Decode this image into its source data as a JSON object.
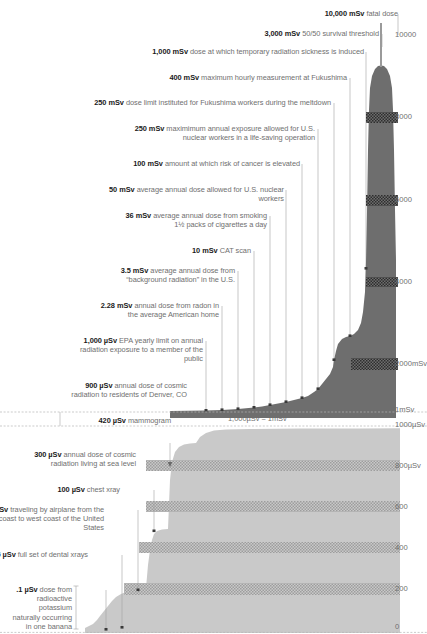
{
  "chart_data": {
    "type": "area",
    "note": "1,000µSv = 1mSv",
    "panels": [
      {
        "name": "upper-panel-msv",
        "ylabel": "mSv",
        "ylim": [
          0,
          11000
        ],
        "ticks": [
          "10000",
          "8000",
          "6000",
          "4000",
          "2000mSv",
          "1mSv"
        ],
        "tick_values": [
          10000,
          8000,
          6000,
          4000,
          2000,
          1
        ],
        "categories": [
          "420 µSv mammogram",
          "900 µSv cosmic radiation Denver",
          "1,000 µSv EPA yearly limit",
          "2.28 mSv radon average home",
          "3.5 mSv background radiation U.S.",
          "10 mSv CAT scan",
          "36 mSv smoking 1½ packs a day",
          "50 mSv U.S. nuclear workers",
          "100 mSv cancer risk elevated",
          "250 mSv life-saving operation",
          "250 mSv Fukushima workers",
          "400 mSv Fukushima hourly max",
          "1,000 mSv radiation sickness",
          "3,000 mSv 50/50 survival",
          "10,000 mSv fatal dose"
        ],
        "values": [
          0.42,
          0.9,
          1.0,
          2.28,
          3.5,
          10,
          36,
          50,
          100,
          250,
          250,
          400,
          1000,
          3000,
          10000
        ]
      },
      {
        "name": "lower-panel-usv",
        "ylabel": "µSv",
        "ylim": [
          0,
          1000
        ],
        "ticks": [
          "1000µSv",
          "800µSv",
          "600",
          "400",
          "200",
          "0"
        ],
        "tick_values": [
          1000,
          800,
          600,
          400,
          200,
          0
        ],
        "categories": [
          ".1 µSv one banana",
          "5 µSv dental xrays",
          "35 µSv airplane coast to coast",
          "100 µSv chest xray",
          "300 µSv cosmic radiation sea level"
        ],
        "values": [
          0.1,
          5,
          35,
          100,
          300
        ]
      }
    ]
  },
  "divider": {
    "caption": "1,000µSv = 1mSv"
  },
  "axis": {
    "upper_ticks": [
      {
        "label": "10000",
        "y": 35
      },
      {
        "label": "8000",
        "y": 117
      },
      {
        "label": "6000",
        "y": 200
      },
      {
        "label": "4000",
        "y": 282
      },
      {
        "label": "2000mSv",
        "y": 364
      },
      {
        "label": "1mSv",
        "y": 410
      }
    ],
    "lower_ticks": [
      {
        "label": "1000µSv",
        "y": 425
      },
      {
        "label": "800µSv",
        "y": 466
      },
      {
        "label": "600",
        "y": 507
      },
      {
        "label": "400",
        "y": 548
      },
      {
        "label": "200",
        "y": 589
      },
      {
        "label": "0",
        "y": 627
      }
    ]
  },
  "labels_upper": [
    {
      "id": "fatal-dose",
      "amount": "10,000 mSv",
      "desc": " fatal dose",
      "right": 29,
      "top": 9,
      "width": 260
    },
    {
      "id": "survival-threshold",
      "amount": "3,000 mSv",
      "desc": " 50/50 survival threshold",
      "right": 48,
      "top": 29,
      "width": 260
    },
    {
      "id": "radiation-sickness",
      "amount": "1,000 mSv",
      "desc": " dose at which temporary radiation sickness is induced",
      "right": 63,
      "top": 47,
      "width": 215
    },
    {
      "id": "fukushima-hourly-max",
      "amount": "400 mSv",
      "desc": " maximum hourly measurement at Fukushima",
      "right": 80,
      "top": 73,
      "width": 200
    },
    {
      "id": "fukushima-worker-limit",
      "amount": "250 mSv",
      "desc": " dose limit instituted for Fukushima workers during the meltdown",
      "right": 96,
      "top": 98,
      "width": 240
    },
    {
      "id": "nuclear-life-saving",
      "amount": "250 mSv",
      "desc": " maximimum annual exposure allowed for U.S. nuclear workers in a life-saving operation",
      "right": 112,
      "top": 124,
      "width": 190
    },
    {
      "id": "cancer-risk-elevated",
      "amount": "100 mSv",
      "desc": " amount at which risk of cancer is elevated",
      "right": 127,
      "top": 159,
      "width": 175
    },
    {
      "id": "nuclear-worker-annual",
      "amount": "50 mSv",
      "desc": " average annual dose allowed for U.S. nuclear workers",
      "right": 143,
      "top": 185,
      "width": 175
    },
    {
      "id": "smoking-annual",
      "amount": "36 mSv",
      "desc": " average annual dose from smoking 1½ packs of cigarettes a day",
      "right": 160,
      "top": 211,
      "width": 145
    },
    {
      "id": "cat-scan",
      "amount": "10 mSv",
      "desc": " CAT scan",
      "right": 176,
      "top": 246,
      "width": 160
    },
    {
      "id": "background-radiation",
      "amount": "3.5 mSv",
      "desc": " average annual dose from “background radiation” in the U.S.",
      "right": 192,
      "top": 266,
      "width": 125
    },
    {
      "id": "radon-home",
      "amount": "2.28 mSv",
      "desc": " annual dose from radon in the average American home",
      "right": 208,
      "top": 301,
      "width": 125
    },
    {
      "id": "epa-yearly-limit",
      "amount": "1,000 µSv",
      "desc": " EPA yearly limit on annual radiation exposure to a member of the public",
      "right": 224,
      "top": 336,
      "width": 130
    },
    {
      "id": "denver-cosmic",
      "amount": "900 µSv",
      "desc": " annual dose of cosmic radiation to residents of Denver, CO",
      "right": 240,
      "top": 381,
      "width": 125
    },
    {
      "id": "mammogram",
      "amount": "420 µSv",
      "desc": " mammogram",
      "right": 256,
      "top": 416,
      "width": 150
    }
  ],
  "labels_lower": [
    {
      "id": "sea-level-cosmic",
      "amount": "300 µSv",
      "desc": " annual dose of cosmic radiation living at sea level",
      "right": 291,
      "top": 450,
      "width": 125
    },
    {
      "id": "chest-xray",
      "amount": "100 µSv",
      "desc": " chest xray",
      "right": 307,
      "top": 485,
      "width": 150
    },
    {
      "id": "airplane-coast-to-coast",
      "amount": "35 µSv",
      "desc": " traveling by airplane from the east coast to west coast of the United States",
      "right": 323,
      "top": 505,
      "width": 125
    },
    {
      "id": "dental-xrays",
      "amount": "5 µSv",
      "desc": " full set of dental xrays",
      "right": 339,
      "top": 550,
      "width": 105
    },
    {
      "id": "banana",
      "amount": ".1 µSv",
      "desc": " dose from radioactive potassium naturally occurring in one banana",
      "right": 355,
      "top": 585,
      "width": 62
    }
  ],
  "colors": {
    "dark_fill": "#6e6e6e",
    "light_fill": "#c9c9c9",
    "band": "#aaaaaa",
    "leader_line": "#9a9a9a",
    "text_bold": "#1a1a1a",
    "text_desc": "#6f6f6f",
    "tick_text": "#6f6f6f"
  }
}
